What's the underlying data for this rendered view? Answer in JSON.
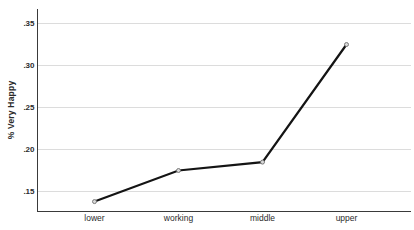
{
  "chart": {
    "y_axis_title": "% Very Happy"
  },
  "chart_data": {
    "type": "line",
    "categories": [
      "lower",
      "working",
      "middle",
      "upper"
    ],
    "values": [
      0.138,
      0.175,
      0.185,
      0.325
    ],
    "title": "",
    "xlabel": "",
    "ylabel": "% Very Happy",
    "yticks": [
      0.15,
      0.2,
      0.25,
      0.3,
      0.35
    ],
    "ytick_labels": [
      ".15",
      ".20",
      ".25",
      ".30",
      ".35"
    ],
    "ylim": [
      0.126,
      0.363
    ],
    "grid": "horizontal-only",
    "legend": "none",
    "marker": "open-circle",
    "colors": {
      "line": "#141414",
      "marker_fill": "#d9d9d9",
      "marker_stroke": "#6e6e6e",
      "grid": "#dcdcdc",
      "axis": "#3a3a3a",
      "tick_text": "#2b2b2b",
      "background": "#ffffff"
    }
  }
}
